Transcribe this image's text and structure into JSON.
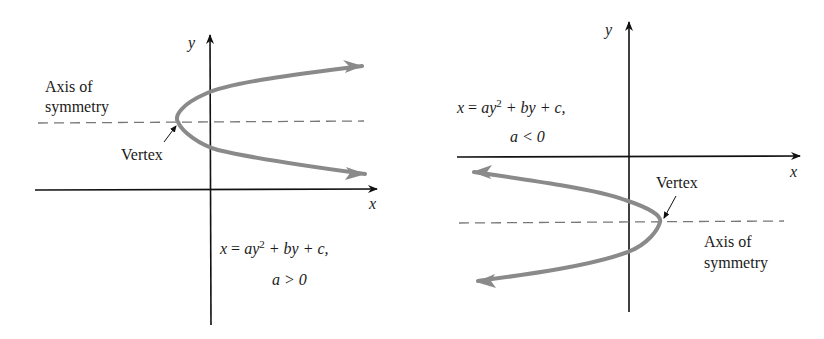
{
  "left_panel": {
    "axis_y_label": "y",
    "axis_x_label": "x",
    "axis_of_symmetry_line1": "Axis of",
    "axis_of_symmetry_line2": "symmetry",
    "vertex_label": "Vertex",
    "equation": {
      "x": "x",
      "eq": " = ",
      "ay": "ay",
      "exp": "2",
      "rest": " + by + c,",
      "condition": "a > 0"
    }
  },
  "right_panel": {
    "axis_y_label": "y",
    "axis_x_label": "x",
    "axis_of_symmetry_line1": "Axis of",
    "axis_of_symmetry_line2": "symmetry",
    "vertex_label": "Vertex",
    "equation": {
      "x": "x",
      "eq": " = ",
      "ay": "ay",
      "exp": "2",
      "rest": " + by + c,",
      "condition": "a < 0"
    }
  },
  "colors": {
    "curve": "#8a8a8a",
    "axes": "#111111",
    "dash": "#777777",
    "text": "#1a1a1a"
  }
}
